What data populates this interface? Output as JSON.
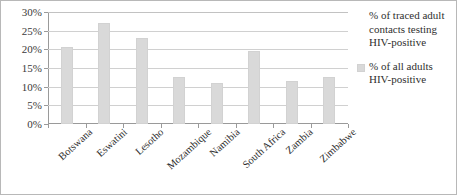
{
  "chart_data": {
    "type": "bar",
    "title": "",
    "subtitle": "",
    "xlabel": "",
    "ylabel": "",
    "ylim": [
      0,
      30
    ],
    "ytick_values": [
      30,
      25,
      20,
      15,
      10,
      5,
      0
    ],
    "ytick_labels": [
      "30%",
      "25%",
      "20%",
      "15%",
      "10%",
      "5%",
      "0%"
    ],
    "grid": true,
    "legend_position": "right",
    "categories": [
      "Botswana",
      "Eswatini",
      "Lesotho",
      "Mozambique",
      "Namibia",
      "South Africa",
      "Zambia",
      "Zimbabwe"
    ],
    "series": [
      {
        "name": "% of traced adult contacts testing HIV-positive",
        "values": [
          null,
          null,
          null,
          null,
          null,
          null,
          null,
          null
        ],
        "color": "#ffffff"
      },
      {
        "name": "% of all adults HIV-positive",
        "values": [
          20.5,
          27.0,
          23.0,
          12.5,
          11.0,
          19.5,
          11.5,
          12.5
        ],
        "color": "#d9d9d9"
      }
    ]
  },
  "legend": {
    "entries": [
      {
        "label": "% of traced adult contacts testing HIV-positive"
      },
      {
        "label": "% of all adults HIV-positive"
      }
    ]
  },
  "top_clip": {
    "text": ""
  },
  "colors": {
    "bar_fill": "#d9d9d9",
    "bar_edge": "#d2d2d2",
    "axis": "#9a9a9a",
    "gridline": "#d0d0d0",
    "text": "#2f2f2f",
    "frame_border": "#b8b8b8",
    "background": "#ffffff"
  }
}
